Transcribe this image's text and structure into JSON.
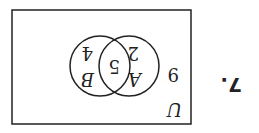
{
  "problem": {
    "number": "7."
  },
  "venn": {
    "universe_label": "U",
    "sets": [
      {
        "label": "A",
        "only_value": "2"
      },
      {
        "label": "B",
        "only_value": "4"
      }
    ],
    "intersection_value": "5",
    "outside_value": "9"
  },
  "display": {
    "rotation_deg": 180,
    "stroke_color": "#222222"
  }
}
